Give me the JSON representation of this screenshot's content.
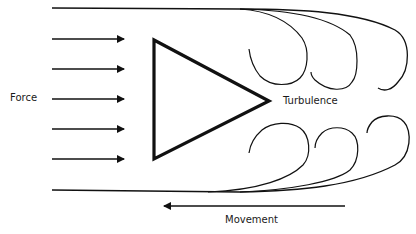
{
  "labels": {
    "force": "Force",
    "turbulence": "Turbulence",
    "movement": "Movement"
  },
  "colors": {
    "stroke": "#111111",
    "background": "#ffffff"
  },
  "diagram": {
    "force_arrows_count": 5,
    "object_shape": "triangle",
    "movement_direction": "left",
    "force_direction": "right"
  }
}
